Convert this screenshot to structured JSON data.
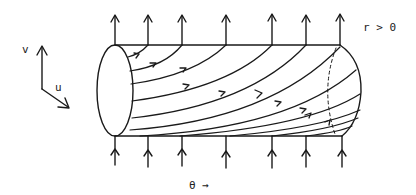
{
  "labels": {
    "v_axis": "v",
    "u_axis": "u",
    "r_condition": "r > 0",
    "theta_direction": "θ →"
  },
  "diagram": {
    "stroke_color": "#1a1a1a",
    "top_arrow_x": [
      115,
      148,
      182,
      226,
      272,
      306,
      340
    ],
    "bottom_arrow_x": [
      115,
      148,
      182,
      226,
      272,
      306,
      340
    ]
  }
}
